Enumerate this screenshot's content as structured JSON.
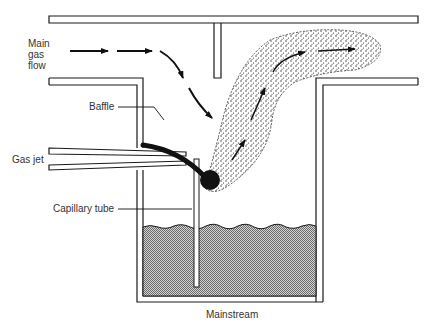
{
  "diagram": {
    "labels": {
      "main_gas_flow": [
        "Main",
        "gas",
        "flow"
      ],
      "baffle": "Baffle",
      "gas_jet": "Gas jet",
      "capillary_tube": "Capillary tube",
      "mainstream": "Mainstream"
    },
    "colors": {
      "line": "#1a1a1a",
      "liquid": "#b8b8b8",
      "stipple": "#222222",
      "text": "#333333"
    }
  }
}
